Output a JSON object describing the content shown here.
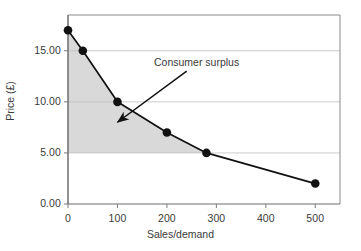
{
  "chart_data": {
    "type": "line",
    "title": "",
    "subtitle": "",
    "xlabel": "Sales/demand",
    "ylabel": "Price (£)",
    "xlim": [
      0,
      550
    ],
    "ylim": [
      0,
      18.5
    ],
    "grid": "horizontal",
    "legend": "none",
    "x": [
      0,
      30,
      100,
      200,
      280,
      500
    ],
    "values": [
      17.0,
      15.0,
      10.0,
      7.0,
      5.0,
      2.0
    ],
    "series": [
      {
        "name": "Demand curve",
        "x": [
          0,
          30,
          100,
          200,
          280,
          500
        ],
        "values": [
          17.0,
          15.0,
          10.0,
          7.0,
          5.0,
          2.0
        ]
      }
    ],
    "x_ticks": [
      "0",
      "100",
      "200",
      "300",
      "400",
      "500"
    ],
    "x_tick_values": [
      0,
      100,
      200,
      300,
      400,
      500
    ],
    "y_ticks": [
      "0.00",
      "5.00",
      "10.00",
      "15.00"
    ],
    "y_tick_values": [
      0,
      5,
      10,
      15
    ],
    "shaded_region": {
      "label": "Consumer surplus",
      "price_floor": 5.0,
      "x_start": 0,
      "x_end": 280,
      "fill_color": "#d9d9d9"
    },
    "annotations": [
      {
        "text": "Consumer surplus",
        "arrow_from_x": 240,
        "arrow_from_y": 13.0,
        "arrow_to_x": 100,
        "arrow_to_y": 8.0
      }
    ],
    "colors": {
      "line": "#111111",
      "marker": "#111111",
      "grid": "#bfbfbf",
      "axis": "#7a7a7a",
      "fill": "#d9d9d9",
      "text": "#3a3a3a"
    }
  }
}
